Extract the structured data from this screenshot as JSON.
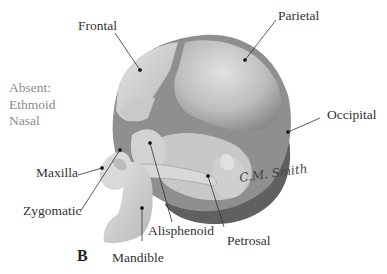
{
  "figure": {
    "panel_label": "B",
    "absent": {
      "heading": "Absent:",
      "items": [
        "Ethmoid",
        "Nasal"
      ]
    },
    "labels": {
      "frontal": "Frontal",
      "parietal": "Parietal",
      "occipital": "Occipital",
      "maxilla": "Maxilla",
      "zygomatic": "Zygomatic",
      "mandible": "Mandible",
      "alisphenoid": "Alisphenoid",
      "petrosal": "Petrosal"
    },
    "signature": "C.M. Smith",
    "colors": {
      "bone_light": "#d4d4d4",
      "bone_mid": "#b3b3b3",
      "suture_dark": "#7c7c7c",
      "shadow": "#555555",
      "label_text": "#333333",
      "absent_text": "#8a8a8a"
    }
  }
}
